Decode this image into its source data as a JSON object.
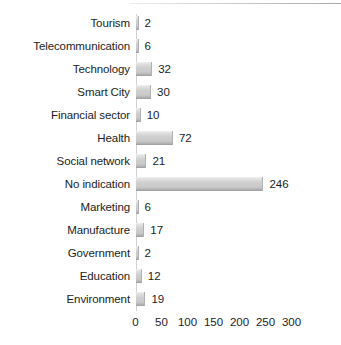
{
  "chart_data": {
    "type": "bar",
    "orientation": "horizontal",
    "title": "",
    "subtitle": "",
    "xlabel": "",
    "ylabel": "",
    "xlim": [
      0,
      300
    ],
    "xticks": [
      0,
      50,
      100,
      150,
      200,
      250,
      300
    ],
    "grid": false,
    "legend": false,
    "bar_color": "#cccccc",
    "text_color": "#201d1e",
    "background": "#ffffff",
    "categories": [
      "Tourism",
      "Telecommunication",
      "Technology",
      "Smart City",
      "Financial sector",
      "Health",
      "Social network",
      "No indication",
      "Marketing",
      "Manufacture",
      "Government",
      "Education",
      "Environment"
    ],
    "values": [
      2,
      6,
      32,
      30,
      10,
      72,
      21,
      246,
      6,
      17,
      2,
      12,
      19
    ],
    "data_labels": [
      "2",
      "6",
      "32",
      "30",
      "10",
      "72",
      "21",
      "246",
      "6",
      "17",
      "2",
      "12",
      "19"
    ],
    "tick_labels": [
      "0",
      "50",
      "100",
      "150",
      "200",
      "250",
      "300"
    ]
  }
}
